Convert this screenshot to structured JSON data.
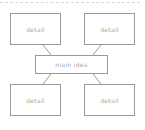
{
  "diagram": {
    "type": "mind-map",
    "center": {
      "label": "main idea"
    },
    "nodes": [
      {
        "label": "detail",
        "position": "top-left"
      },
      {
        "label": "detail",
        "position": "top-right"
      },
      {
        "label": "detail",
        "position": "bottom-left"
      },
      {
        "label": "detail",
        "position": "bottom-right"
      }
    ],
    "colors": {
      "border": "#9a9a9a",
      "text": "#a8a8a8",
      "dash": "#d8d8d8"
    }
  }
}
